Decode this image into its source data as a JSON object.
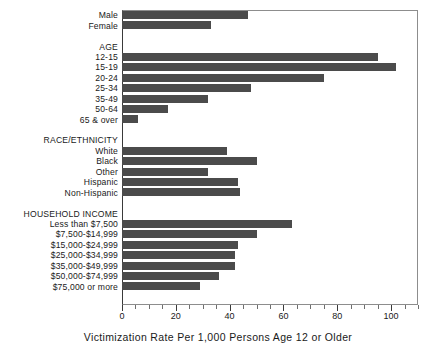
{
  "chart_data": {
    "type": "bar",
    "orientation": "horizontal",
    "title": "",
    "xlabel": "Victimization Rate Per 1,000 Persons Age 12 or Older",
    "ylabel": "",
    "xlim": [
      0,
      110
    ],
    "grid": false,
    "legend": "none",
    "xticks": [
      0,
      20,
      40,
      60,
      80,
      100
    ],
    "xtick_labels": [
      "0",
      "20",
      "40",
      "60",
      "80",
      "100"
    ],
    "minor_tick_interval": 5,
    "bar_color": "#4b4b4b",
    "groups": [
      {
        "heading": "",
        "rows": [
          {
            "label": "Male",
            "value": 47
          },
          {
            "label": "Female",
            "value": 33
          }
        ]
      },
      {
        "heading": "AGE",
        "rows": [
          {
            "label": "12-15",
            "value": 95
          },
          {
            "label": "15-19",
            "value": 102
          },
          {
            "label": "20-24",
            "value": 75
          },
          {
            "label": "25-34",
            "value": 48
          },
          {
            "label": "35-49",
            "value": 32
          },
          {
            "label": "50-64",
            "value": 17
          },
          {
            "label": "65 & over",
            "value": 6
          }
        ]
      },
      {
        "heading": "RACE/ETHNICITY",
        "rows": [
          {
            "label": "White",
            "value": 39
          },
          {
            "label": "Black",
            "value": 50
          },
          {
            "label": "Other",
            "value": 32
          },
          {
            "label": "Hispanic",
            "value": 43
          },
          {
            "label": "Non-Hispanic",
            "value": 44
          }
        ]
      },
      {
        "heading": "HOUSEHOLD INCOME",
        "rows": [
          {
            "label": "Less than $7,500",
            "value": 63
          },
          {
            "label": "$7,500-$14,999",
            "value": 50
          },
          {
            "label": "$15,000-$24,999",
            "value": 43
          },
          {
            "label": "$25,000-$34,999",
            "value": 42
          },
          {
            "label": "$35,000-$49,999",
            "value": 42
          },
          {
            "label": "$50,000-$74,999",
            "value": 36
          },
          {
            "label": "$75,000 or more",
            "value": 29
          }
        ]
      }
    ]
  }
}
